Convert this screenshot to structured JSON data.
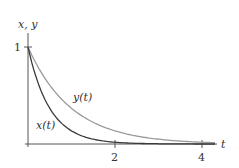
{
  "chart_data": {
    "type": "line",
    "title": "",
    "xlabel": "t",
    "ylabel": "x, y",
    "xlim": [
      0,
      4.4
    ],
    "ylim": [
      0,
      1.15
    ],
    "x_ticks": [
      {
        "value": 2,
        "label": "2"
      },
      {
        "value": 4,
        "label": "4"
      }
    ],
    "y_ticks": [
      {
        "value": 1,
        "label": "1"
      }
    ],
    "grid": false,
    "legend": "inline labels",
    "series": [
      {
        "name": "x(t)",
        "color": "#3a3a3a",
        "x": [
          0,
          0.25,
          0.5,
          0.75,
          1,
          1.5,
          2,
          2.5,
          3,
          3.5,
          4,
          4.3
        ],
        "values": [
          1,
          0.61,
          0.37,
          0.22,
          0.14,
          0.05,
          0.02,
          0.01,
          0.0,
          0.0,
          0.0,
          0.0
        ]
      },
      {
        "name": "y(t)",
        "color": "#9a9a9a",
        "x": [
          0,
          0.25,
          0.5,
          0.75,
          1,
          1.5,
          2,
          2.5,
          3,
          3.5,
          4,
          4.3
        ],
        "values": [
          1,
          0.78,
          0.61,
          0.47,
          0.37,
          0.22,
          0.14,
          0.08,
          0.05,
          0.03,
          0.02,
          0.01
        ]
      }
    ]
  },
  "labels": {
    "y_axis": "x, y",
    "x_axis": "t",
    "y_tick_1": "1",
    "x_tick_2": "2",
    "x_tick_4": "4",
    "series_x": "x(t)",
    "series_y": "y(t)"
  }
}
